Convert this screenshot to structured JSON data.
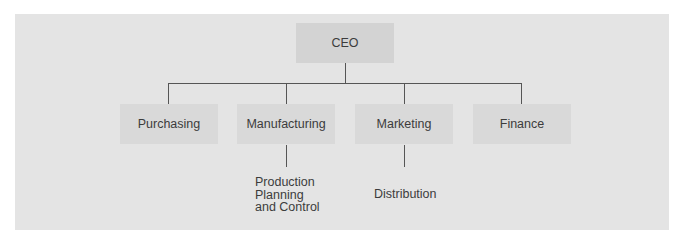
{
  "diagram": {
    "type": "org-chart",
    "root": {
      "label": "CEO"
    },
    "departments": [
      {
        "label": "Purchasing",
        "children": []
      },
      {
        "label": "Manufacturing",
        "children": [
          {
            "label_lines": [
              "Production",
              "Planning",
              "and Control"
            ]
          }
        ]
      },
      {
        "label": "Marketing",
        "children": [
          {
            "label": "Distribution"
          }
        ]
      },
      {
        "label": "Finance",
        "children": []
      }
    ]
  },
  "colors": {
    "panel": "#e4e4e4",
    "box": "#d9d9d9",
    "root_box": "#d3d3d3",
    "connector": "#555555",
    "text": "#3c3c3c"
  }
}
